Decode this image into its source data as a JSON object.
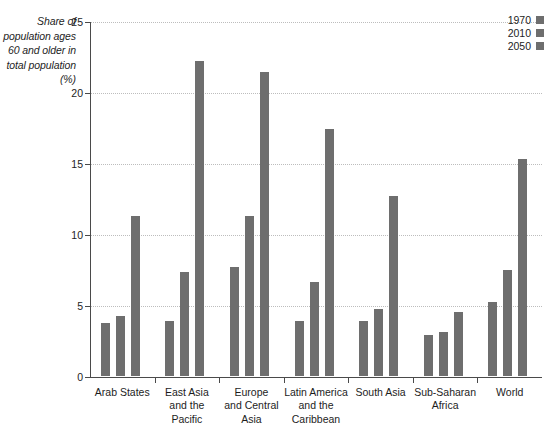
{
  "chart_data": {
    "type": "bar",
    "title": "",
    "subtitle": "",
    "xlabel": "",
    "ylabel": "Share of\npopulation\nages 60\nand older\nin total\npopulation\n(%)",
    "ylim": [
      0,
      25
    ],
    "yticks": [
      0,
      5,
      10,
      15,
      20,
      25
    ],
    "ytick_labels": [
      "0",
      "5",
      "10",
      "15",
      "20",
      "25"
    ],
    "grid": true,
    "grid_style": "dotted-horizontal",
    "legend_position": "top-right",
    "categories": [
      "Arab States",
      "East Asia\nand the Pacific",
      "Europe\nand Central Asia",
      "Latin America\nand the\nCaribbean",
      "South Asia",
      "Sub-Saharan\nAfrica",
      "World"
    ],
    "series": [
      {
        "name": "1970",
        "color": "#6e6e6e",
        "values": [
          3.7,
          3.9,
          7.7,
          3.9,
          3.9,
          2.9,
          5.2
        ]
      },
      {
        "name": "2010",
        "color": "#6e6e6e",
        "values": [
          4.2,
          7.3,
          11.3,
          6.6,
          4.7,
          3.1,
          7.5
        ]
      },
      {
        "name": "2050",
        "color": "#6e6e6e",
        "values": [
          11.3,
          22.2,
          21.4,
          17.4,
          12.7,
          4.5,
          15.3
        ]
      }
    ]
  },
  "legend": {
    "entries": [
      {
        "label": "1970",
        "color": "#6e6e6e"
      },
      {
        "label": "2010",
        "color": "#6e6e6e"
      },
      {
        "label": "2050",
        "color": "#6e6e6e"
      }
    ]
  },
  "axis": {
    "y_title": "Share of\npopulation\nages 60\nand older\nin total\npopulation\n(%)"
  },
  "colors": {
    "bar": "#6e6e6e",
    "axis": "#4a4a4a",
    "grid": "#bdbdbd",
    "text": "#1d1d1d",
    "background": "#ffffff"
  }
}
